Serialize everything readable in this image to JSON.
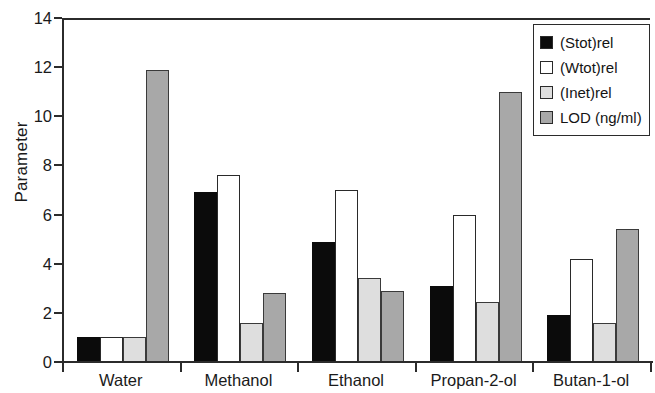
{
  "chart_data": {
    "type": "bar",
    "title": "",
    "xlabel": "",
    "ylabel": "Parameter",
    "ylim": [
      0,
      14
    ],
    "yticks": [
      0,
      2,
      4,
      6,
      8,
      10,
      12,
      14
    ],
    "ytick_labels": [
      "0",
      "2",
      "4",
      "6",
      "8",
      "10",
      "12",
      "14"
    ],
    "grid": false,
    "legend_position": "top-right",
    "categories": [
      "Water",
      "Methanol",
      "Ethanol",
      "Propan-2-ol",
      "Butan-1-ol"
    ],
    "series": [
      {
        "name": "(Stot)rel",
        "color": "#0b0b0b",
        "fill": "solid-black",
        "values": [
          1.0,
          6.9,
          4.9,
          3.1,
          1.9
        ]
      },
      {
        "name": "(Wtot)rel",
        "color": "#ffffff",
        "fill": "white",
        "values": [
          1.0,
          7.6,
          7.0,
          6.0,
          4.2
        ]
      },
      {
        "name": "(Inet)rel",
        "color": "#dedede",
        "fill": "light-gray",
        "values": [
          1.0,
          1.6,
          3.4,
          2.45,
          1.6
        ]
      },
      {
        "name": "LOD (ng/ml)",
        "color": "#a8a8a8",
        "fill": "medium-gray",
        "values": [
          11.9,
          2.8,
          2.9,
          11.0,
          5.4
        ]
      }
    ]
  },
  "legend": {
    "items": [
      {
        "label": "(Stot)rel",
        "swatch": "#0b0b0b"
      },
      {
        "label": "(Wtot)rel",
        "swatch": "#ffffff"
      },
      {
        "label": "(Inet)rel",
        "swatch": "#dedede"
      },
      {
        "label": "LOD (ng/ml)",
        "swatch": "#a8a8a8"
      }
    ]
  }
}
